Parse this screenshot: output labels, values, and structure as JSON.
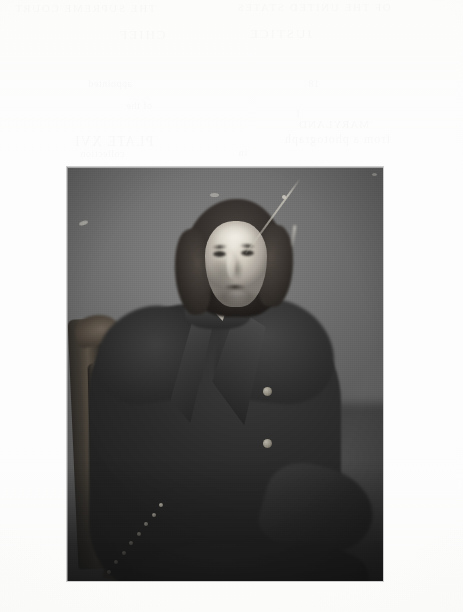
{
  "page": {
    "kind": "scanned-book-page",
    "background_color": "#fdfdfd",
    "width_px": 463,
    "height_px": 612,
    "caption_text": "",
    "page_number_text": ""
  },
  "bleed_through": {
    "description": "faint mirrored show-through of text printed on the reverse of the leaf; illegible at this resolution",
    "opacity": "0.018",
    "lines": [
      {
        "id": 1,
        "text": "THE SUPREME COURT"
      },
      {
        "id": 2,
        "text": "OF THE UNITED STATES"
      },
      {
        "id": 3,
        "text": "CHIEF"
      },
      {
        "id": 4,
        "text": "JUSTICE"
      },
      {
        "id": 5,
        "text": "appointed"
      },
      {
        "id": 6,
        "text": "18"
      },
      {
        "id": 7,
        "text": "of the"
      },
      {
        "id": 8,
        "text": "I"
      },
      {
        "id": 9,
        "text": "MARYLAND"
      },
      {
        "id": 10,
        "text": "PLATE XVI"
      },
      {
        "id": 11,
        "text": "from a photograph"
      },
      {
        "id": 12,
        "text": "in"
      },
      {
        "id": 13,
        "text": "collection"
      }
    ]
  },
  "plate": {
    "label": "photographic-plate",
    "medium": "black-and-white halftone photograph",
    "frame": {
      "left_px": 67,
      "top_px": 167,
      "width_px": 316,
      "height_px": 414
    },
    "backdrop_color": "#6b6b6b",
    "shadow_color": "#1c1c1c",
    "subject": {
      "description": "elderly man seated three-quarters facing the viewer",
      "era": "mid-19th century",
      "hair": "long dark wavy hair swept back, covering the ears",
      "face": "gaunt, deeply lined, clean-shaven",
      "garment": "dark double-breasted frock coat with broad lapels",
      "neckwear": "white shirt collar and pale cravat",
      "hands": "both hands pale and prominent; left resting in the lap, right draped over the table edge",
      "seat": "carved wooden armchair with studded upholstery",
      "buttons_visible": 2
    },
    "condition": {
      "description": "light diagonal emulsion scratch across the upper-right background plus scattered light specks",
      "scratch_count": 2,
      "speck_count": 4
    },
    "tack_count": 8
  },
  "colors": {
    "paper": "#fdfdfd",
    "backdrop_mid_grey": "#6b6b6b",
    "coat_black": "#262626",
    "skin_highlight": "#eae5db",
    "wood_chair": "#564d42",
    "deep_shadow": "#161616"
  }
}
